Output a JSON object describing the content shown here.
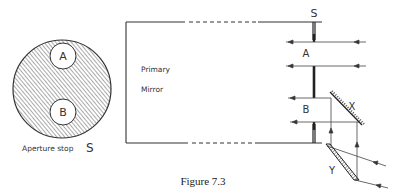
{
  "figure": {
    "caption": "Figure 7.3"
  },
  "aperture_stop": {
    "label": "Aperture stop",
    "symbol": "S",
    "holes": [
      "A",
      "B"
    ]
  },
  "telescope": {
    "stop_label": "S",
    "mirror_label_line1": "Primary",
    "mirror_label_line2": "Mirror",
    "beam_labels": [
      "A",
      "B"
    ],
    "mirror_labels": [
      "X",
      "Y"
    ]
  },
  "colors": {
    "line": "#333333",
    "hatch": "#555555",
    "background": "#ffffff"
  }
}
